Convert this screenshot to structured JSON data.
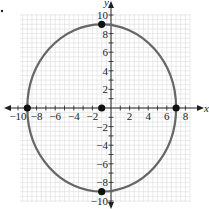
{
  "chart_data": {
    "type": "scatter",
    "title": "",
    "xlabel": "x",
    "ylabel": "y",
    "xlim": [
      -10,
      10
    ],
    "ylim": [
      -10,
      10
    ],
    "grid": true,
    "x_ticks": [
      -10,
      -8,
      -6,
      -4,
      -2,
      2,
      4,
      6,
      8
    ],
    "y_ticks": [
      -10,
      -8,
      -6,
      -4,
      -2,
      2,
      4,
      6,
      8,
      10
    ],
    "curve": {
      "kind": "ellipse",
      "center": [
        -1,
        0
      ],
      "semi_axis_x": 8,
      "semi_axis_y": 9,
      "color": "#666666"
    },
    "points": [
      {
        "label": "center",
        "x": -1,
        "y": 0
      },
      {
        "label": "left-vertex",
        "x": -9,
        "y": 0
      },
      {
        "label": "right-vertex",
        "x": 7,
        "y": 0
      },
      {
        "label": "top-vertex",
        "x": -1,
        "y": 9
      },
      {
        "label": "bottom-vertex",
        "x": -1,
        "y": -9
      }
    ],
    "colors": {
      "grid": "#dcdcdc",
      "axis": "#222222",
      "curve": "#666666",
      "point": "#111111"
    }
  },
  "labels": {
    "x_axis": "x",
    "y_axis": "y"
  }
}
